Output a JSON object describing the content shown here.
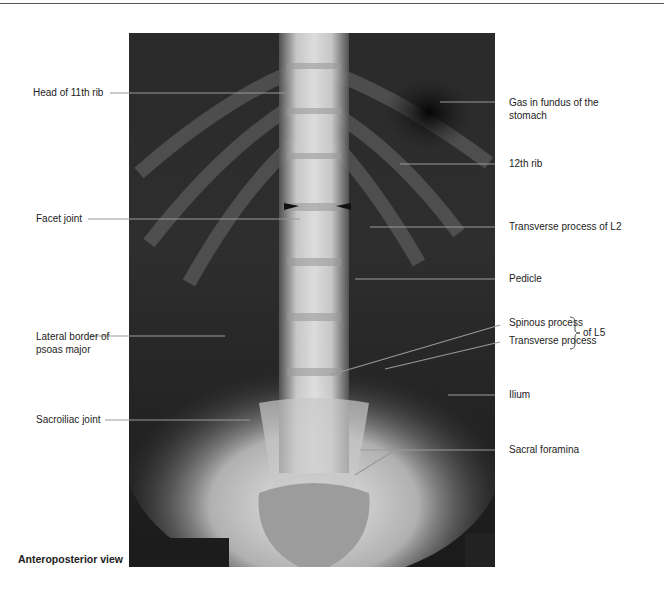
{
  "figure": {
    "header_stub": "Pelvis",
    "caption": "Anteroposterior view",
    "image_description": "Anteroposterior radiograph of lumbar spine and pelvis",
    "labels_left": [
      {
        "id": "head-11th-rib",
        "text": "Head of 11th rib"
      },
      {
        "id": "facet-joint",
        "text": "Facet joint"
      },
      {
        "id": "lateral-border-psoas",
        "text": "Lateral border of psoas major"
      },
      {
        "id": "sacroiliac-joint",
        "text": "Sacroiliac joint"
      }
    ],
    "labels_right": [
      {
        "id": "gas-fundus",
        "text": "Gas in fundus of the stomach"
      },
      {
        "id": "12th-rib",
        "text": "12th rib"
      },
      {
        "id": "transverse-process-l2",
        "text": "Transverse process of L2"
      },
      {
        "id": "pedicle",
        "text": "Pedicle"
      },
      {
        "id": "spinous-process",
        "text": "Spinous process"
      },
      {
        "id": "transverse-process",
        "text": "Transverse process"
      },
      {
        "id": "ilium",
        "text": "Ilium"
      },
      {
        "id": "sacral-foramina",
        "text": "Sacral foramina"
      }
    ],
    "bracket_label": "of L5"
  }
}
